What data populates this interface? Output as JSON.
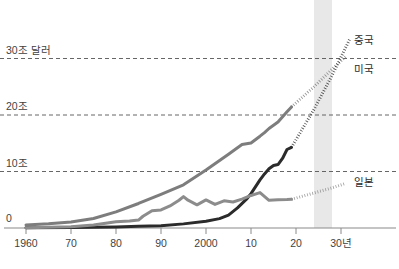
{
  "chart_data": {
    "type": "line",
    "title": "",
    "xlabel": "",
    "ylabel": "",
    "xlim": [
      1960,
      2035
    ],
    "ylim": [
      0,
      33
    ],
    "grid": true,
    "gridlines": [
      10,
      20,
      30
    ],
    "y_ticks": [
      "0",
      "10조",
      "20조",
      "30조 달러"
    ],
    "y_tick_values": [
      0,
      10,
      20,
      30
    ],
    "x_ticks": [
      "1960",
      "70",
      "80",
      "90",
      "2000",
      "10",
      "20",
      "30년"
    ],
    "x_tick_values": [
      1960,
      1970,
      1980,
      1990,
      2000,
      2010,
      2020,
      2030
    ],
    "unit_note": "조 달러",
    "legend_position": "right-inline",
    "forecast_band": {
      "start": 2024,
      "end": 2028,
      "color": "#e8e8e8"
    },
    "series": [
      {
        "name": "미국",
        "label": "미국",
        "color": "#7d7d7d",
        "label_x": 2032,
        "label_y": 28.2,
        "actual": [
          {
            "x": 1960,
            "y": 0.54
          },
          {
            "x": 1965,
            "y": 0.74
          },
          {
            "x": 1970,
            "y": 1.07
          },
          {
            "x": 1975,
            "y": 1.69
          },
          {
            "x": 1980,
            "y": 2.86
          },
          {
            "x": 1985,
            "y": 4.34
          },
          {
            "x": 1990,
            "y": 5.96
          },
          {
            "x": 1995,
            "y": 7.64
          },
          {
            "x": 2000,
            "y": 10.25
          },
          {
            "x": 2005,
            "y": 13.04
          },
          {
            "x": 2008,
            "y": 14.77
          },
          {
            "x": 2010,
            "y": 15.05
          },
          {
            "x": 2012,
            "y": 16.25
          },
          {
            "x": 2013,
            "y": 16.88
          },
          {
            "x": 2014,
            "y": 17.61
          },
          {
            "x": 2016,
            "y": 18.75
          },
          {
            "x": 2018,
            "y": 20.58
          },
          {
            "x": 2019,
            "y": 21.43
          }
        ],
        "forecast": [
          {
            "x": 2019,
            "y": 21.43
          },
          {
            "x": 2024,
            "y": 25.0
          },
          {
            "x": 2028,
            "y": 28.1
          },
          {
            "x": 2031,
            "y": 30.3
          }
        ]
      },
      {
        "name": "중국",
        "label": "중국",
        "color": "#2b2b2b",
        "label_x": 2032,
        "label_y": 33.2,
        "actual": [
          {
            "x": 1960,
            "y": 0.06
          },
          {
            "x": 1970,
            "y": 0.09
          },
          {
            "x": 1980,
            "y": 0.19
          },
          {
            "x": 1985,
            "y": 0.31
          },
          {
            "x": 1990,
            "y": 0.4
          },
          {
            "x": 1995,
            "y": 0.73
          },
          {
            "x": 2000,
            "y": 1.21
          },
          {
            "x": 2003,
            "y": 1.66
          },
          {
            "x": 2005,
            "y": 2.29
          },
          {
            "x": 2007,
            "y": 3.55
          },
          {
            "x": 2009,
            "y": 5.1
          },
          {
            "x": 2010,
            "y": 6.09
          },
          {
            "x": 2012,
            "y": 8.53
          },
          {
            "x": 2013,
            "y": 9.57
          },
          {
            "x": 2014,
            "y": 10.48
          },
          {
            "x": 2015,
            "y": 11.06
          },
          {
            "x": 2016,
            "y": 11.23
          },
          {
            "x": 2017,
            "y": 12.31
          },
          {
            "x": 2018,
            "y": 13.89
          },
          {
            "x": 2019,
            "y": 14.28
          }
        ],
        "forecast": [
          {
            "x": 2019,
            "y": 14.28
          },
          {
            "x": 2024,
            "y": 21.0
          },
          {
            "x": 2028,
            "y": 27.0
          },
          {
            "x": 2032,
            "y": 33.5
          }
        ]
      },
      {
        "name": "일본",
        "label": "일본",
        "color": "#8c8c8c",
        "label_x": 2032,
        "label_y": 8.1,
        "actual": [
          {
            "x": 1960,
            "y": 0.04
          },
          {
            "x": 1970,
            "y": 0.21
          },
          {
            "x": 1975,
            "y": 0.52
          },
          {
            "x": 1980,
            "y": 1.1
          },
          {
            "x": 1983,
            "y": 1.24
          },
          {
            "x": 1985,
            "y": 1.4
          },
          {
            "x": 1986,
            "y": 2.08
          },
          {
            "x": 1988,
            "y": 3.07
          },
          {
            "x": 1990,
            "y": 3.19
          },
          {
            "x": 1992,
            "y": 3.91
          },
          {
            "x": 1994,
            "y": 4.91
          },
          {
            "x": 1995,
            "y": 5.55
          },
          {
            "x": 1996,
            "y": 4.92
          },
          {
            "x": 1998,
            "y": 4.1
          },
          {
            "x": 2000,
            "y": 4.97
          },
          {
            "x": 2002,
            "y": 4.18
          },
          {
            "x": 2004,
            "y": 4.82
          },
          {
            "x": 2006,
            "y": 4.6
          },
          {
            "x": 2008,
            "y": 5.1
          },
          {
            "x": 2010,
            "y": 5.76
          },
          {
            "x": 2012,
            "y": 6.27
          },
          {
            "x": 2014,
            "y": 4.9
          },
          {
            "x": 2016,
            "y": 5.0
          },
          {
            "x": 2018,
            "y": 5.04
          },
          {
            "x": 2019,
            "y": 5.08
          }
        ],
        "forecast": [
          {
            "x": 2019,
            "y": 5.08
          },
          {
            "x": 2024,
            "y": 6.2
          },
          {
            "x": 2028,
            "y": 7.1
          },
          {
            "x": 2031,
            "y": 7.9
          }
        ]
      }
    ]
  },
  "axis": {
    "y_labels": [
      {
        "text": "30조 달러",
        "value": 30
      },
      {
        "text": "20조",
        "value": 20
      },
      {
        "text": "10조",
        "value": 10
      },
      {
        "text": "0",
        "value": 0
      }
    ],
    "x_labels": [
      {
        "text": "1960",
        "value": 1960
      },
      {
        "text": "70",
        "value": 1970
      },
      {
        "text": "80",
        "value": 1980
      },
      {
        "text": "90",
        "value": 1990
      },
      {
        "text": "2000",
        "value": 2000
      },
      {
        "text": "10",
        "value": 2010
      },
      {
        "text": "20",
        "value": 2020
      },
      {
        "text": "30년",
        "value": 2030
      }
    ]
  },
  "colors": {
    "grid": "#555555",
    "axis": "#8a8a8a",
    "band": "#e9e9e9",
    "china": "#2b2b2b",
    "usa": "#7d7d7d",
    "japan": "#8c8c8c",
    "text": "#3f3f3f"
  },
  "footer": {
    "source": ""
  }
}
